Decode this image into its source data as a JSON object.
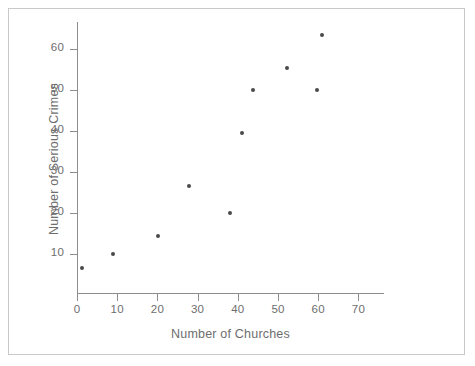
{
  "chart_data": {
    "type": "scatter",
    "title": "",
    "xlabel": "Number of Churches",
    "ylabel": "Number of Serious Crimes",
    "xlim": [
      0,
      76
    ],
    "ylim": [
      0,
      68
    ],
    "xticks": [
      0,
      10,
      20,
      30,
      40,
      50,
      60,
      70
    ],
    "xtick_labels": [
      "0",
      "10",
      "20",
      "30",
      "40",
      "50",
      "60",
      "70"
    ],
    "yticks": [
      10,
      20,
      30,
      40,
      50,
      60
    ],
    "ytick_labels": [
      "10",
      "20",
      "30",
      "40",
      "50",
      "60"
    ],
    "grid": false,
    "legend": null,
    "marker_color": "#4a4a4a",
    "axis_color": "#8d8d8d",
    "text_color": "#6e6e6e",
    "background": "#ffffff",
    "points": [
      {
        "x": 1.3,
        "y": 6.6
      },
      {
        "x": 9.0,
        "y": 10.0
      },
      {
        "x": 20.1,
        "y": 14.5
      },
      {
        "x": 27.8,
        "y": 26.6
      },
      {
        "x": 38.0,
        "y": 20.0
      },
      {
        "x": 41.0,
        "y": 39.5
      },
      {
        "x": 43.9,
        "y": 50.0
      },
      {
        "x": 52.3,
        "y": 55.3
      },
      {
        "x": 59.8,
        "y": 50.0
      },
      {
        "x": 61.0,
        "y": 63.5
      }
    ]
  }
}
